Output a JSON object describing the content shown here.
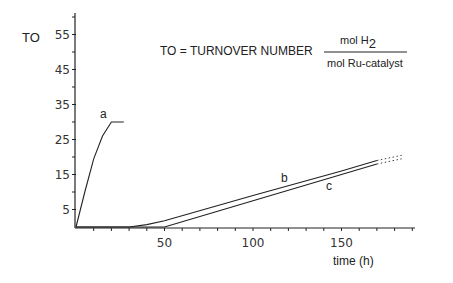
{
  "chart_data": {
    "type": "line",
    "title": "",
    "ylabel": "TO",
    "xlabel": "time (h)",
    "definition": {
      "text": "TO = TURNOVER NUMBER",
      "numerator": "mol H",
      "numerator_sub": "2",
      "denominator": "mol Ru-catalyst"
    },
    "y_ticks": [
      5,
      15,
      25,
      35,
      45,
      55
    ],
    "y_minor_ticks": [
      10,
      20,
      30,
      40,
      50,
      60
    ],
    "x_ticks": [
      50,
      100,
      150
    ],
    "x_minor_step": 10,
    "xlim": [
      0,
      190
    ],
    "ylim": [
      0,
      61
    ],
    "grid": false,
    "series": [
      {
        "name": "a",
        "x": [
          0,
          5,
          10,
          15,
          20,
          27
        ],
        "y": [
          0,
          10,
          19.5,
          26,
          30,
          30
        ]
      },
      {
        "name": "b",
        "x": [
          30,
          40,
          50,
          100,
          150,
          170
        ],
        "y": [
          0,
          0.7,
          1.8,
          9,
          16,
          19
        ],
        "extrapolated": {
          "x": [
            170,
            184
          ],
          "y": [
            19,
            20.5
          ]
        }
      },
      {
        "name": "c",
        "x": [
          50,
          60,
          100,
          150,
          170
        ],
        "y": [
          0,
          1.5,
          7.5,
          15,
          18
        ],
        "extrapolated": {
          "x": [
            170,
            184
          ],
          "y": [
            18,
            19.5
          ]
        }
      }
    ]
  },
  "labels": {
    "y_axis": "TO",
    "x_axis": "time (h)",
    "definition": "TO = TURNOVER NUMBER",
    "numerator": "mol H",
    "numerator_sub": "2",
    "denominator": "mol Ru-catalyst",
    "series_a": "a",
    "series_b": "b",
    "series_c": "c",
    "y_ticks": [
      "5",
      "15",
      "25",
      "35",
      "45",
      "55"
    ],
    "x_ticks": [
      "50",
      "100",
      "150"
    ]
  }
}
